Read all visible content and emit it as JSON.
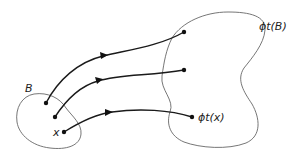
{
  "diagram": {
    "type": "flow-map",
    "labels": {
      "set_B": "B",
      "image_set": "ϕt(B)",
      "point_x": "x",
      "image_point": "ϕt(x)"
    },
    "regions": [
      {
        "name": "B",
        "description": "initial region (small blob, lower-left)"
      },
      {
        "name": "ϕt(B)",
        "description": "image region under flow (large blob, right)"
      }
    ],
    "trajectories": [
      {
        "from": "point in B (upper)",
        "to": "point in ϕt(B) (upper)"
      },
      {
        "from": "point in B (middle)",
        "to": "point in ϕt(B) (middle)"
      },
      {
        "from": "x",
        "to": "ϕt(x)"
      }
    ],
    "colors": {
      "region_stroke": "#666666",
      "flow_stroke": "#1a1a1a",
      "background": "#ffffff"
    }
  }
}
